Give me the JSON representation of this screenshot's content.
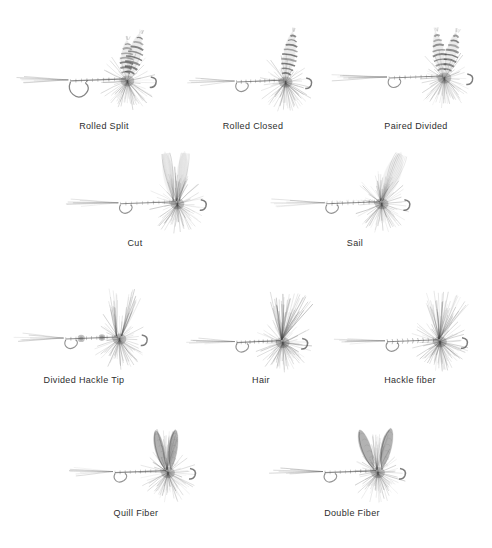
{
  "plate": {
    "title": "Fly Wing Styles",
    "background_color": "#ffffff",
    "ink_color": "#4a4a4a",
    "caption_color": "#2e2e2e",
    "width": 492,
    "height": 548,
    "medium": "graphite pencil illustration",
    "columns": 3,
    "rows": 4
  },
  "figures": [
    {
      "id": "rolled-split",
      "label": "Rolled Split",
      "row": 1,
      "col": 1,
      "wing_style": "rolled-split",
      "wing_count": 2,
      "wing_texture": "barred",
      "wing_lean": "back",
      "has_tail": true,
      "has_hook_bend": true,
      "body_texture": "segmented",
      "x": 10,
      "y": 22,
      "w": 160,
      "h": 95,
      "caption_x": 0,
      "caption_y": 121,
      "caption_w": 208
    },
    {
      "id": "rolled-closed",
      "label": "Rolled Closed",
      "row": 1,
      "col": 2,
      "wing_style": "rolled-closed",
      "wing_count": 1,
      "wing_texture": "barred",
      "wing_lean": "back",
      "has_tail": true,
      "has_hook_bend": true,
      "body_texture": "segmented",
      "x": 183,
      "y": 25,
      "w": 140,
      "h": 92,
      "caption_x": 178,
      "caption_y": 121,
      "caption_w": 150
    },
    {
      "id": "paired-divided",
      "label": "Paired Divided",
      "row": 1,
      "col": 3,
      "wing_style": "paired-divided",
      "wing_count": 2,
      "wing_texture": "barred",
      "wing_lean": "upright-v",
      "has_tail": true,
      "has_hook_bend": true,
      "body_texture": "segmented",
      "x": 330,
      "y": 16,
      "w": 156,
      "h": 100,
      "caption_x": 340,
      "caption_y": 121,
      "caption_w": 152
    },
    {
      "id": "cut",
      "label": "Cut",
      "row": 2,
      "col": 1,
      "wing_style": "cut",
      "wing_count": 2,
      "wing_texture": "veined",
      "wing_lean": "upright",
      "has_tail": true,
      "has_hook_bend": true,
      "body_texture": "segmented",
      "x": 60,
      "y": 148,
      "w": 160,
      "h": 90,
      "caption_x": 80,
      "caption_y": 238,
      "caption_w": 110
    },
    {
      "id": "sail",
      "label": "Sail",
      "row": 2,
      "col": 2,
      "wing_style": "sail",
      "wing_count": 1,
      "wing_texture": "veined",
      "wing_lean": "swept",
      "has_tail": true,
      "has_hook_bend": true,
      "body_texture": "fuzzy-segmented",
      "x": 268,
      "y": 148,
      "w": 155,
      "h": 90,
      "caption_x": 300,
      "caption_y": 238,
      "caption_w": 110
    },
    {
      "id": "divided-hackle-tip",
      "label": "Divided Hackle Tip",
      "row": 3,
      "col": 1,
      "wing_style": "divided-hackle-tip",
      "wing_count": 2,
      "wing_texture": "soft-fiber",
      "wing_lean": "upright-v",
      "has_tail": true,
      "has_hook_bend": true,
      "body_texture": "knotted",
      "x": 8,
      "y": 282,
      "w": 152,
      "h": 92,
      "caption_x": 6,
      "caption_y": 375,
      "caption_w": 156
    },
    {
      "id": "hair",
      "label": "Hair",
      "row": 3,
      "col": 2,
      "wing_style": "hair",
      "wing_count": 1,
      "wing_texture": "spiky-hair",
      "wing_lean": "upright",
      "has_tail": true,
      "has_hook_bend": true,
      "body_texture": "segmented",
      "x": 186,
      "y": 288,
      "w": 132,
      "h": 88,
      "caption_x": 206,
      "caption_y": 375,
      "caption_w": 110
    },
    {
      "id": "hackle-fiber",
      "label": "Hackle fiber",
      "row": 3,
      "col": 3,
      "wing_style": "hackle-fiber",
      "wing_count": 1,
      "wing_texture": "fine-fiber",
      "wing_lean": "upright-fan",
      "has_tail": true,
      "has_hook_bend": true,
      "body_texture": "ribbed",
      "x": 330,
      "y": 286,
      "w": 150,
      "h": 90,
      "caption_x": 334,
      "caption_y": 375,
      "caption_w": 152
    },
    {
      "id": "quill-fiber",
      "label": "Quill Fiber",
      "row": 4,
      "col": 1,
      "wing_style": "quill-fiber",
      "wing_count": 2,
      "wing_texture": "dark-quill",
      "wing_lean": "upright-v",
      "has_tail": true,
      "has_hook_bend": true,
      "body_texture": "segmented",
      "x": 58,
      "y": 418,
      "w": 150,
      "h": 88,
      "caption_x": 76,
      "caption_y": 508,
      "caption_w": 120
    },
    {
      "id": "double-fiber",
      "label": "Double Fiber",
      "row": 4,
      "col": 2,
      "wing_style": "double-fiber",
      "wing_count": 2,
      "wing_texture": "dark-quill",
      "wing_lean": "upright-wide-v",
      "has_tail": true,
      "has_hook_bend": true,
      "body_texture": "segmented",
      "x": 268,
      "y": 418,
      "w": 150,
      "h": 88,
      "caption_x": 290,
      "caption_y": 508,
      "caption_w": 124
    }
  ]
}
